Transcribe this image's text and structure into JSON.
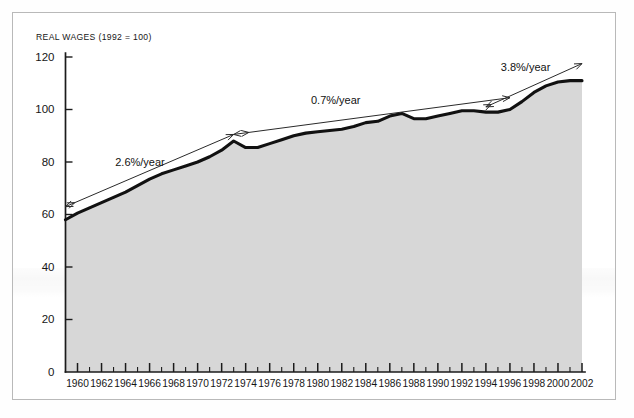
{
  "chart_data": {
    "type": "area",
    "title": "REAL WAGES (1992 = 100)",
    "xlabel": "",
    "ylabel": "",
    "xlim": [
      1959,
      2002
    ],
    "ylim": [
      0,
      120
    ],
    "yticks": [
      0,
      20,
      40,
      60,
      80,
      100,
      120
    ],
    "grid": false,
    "legend": null,
    "x": [
      1959,
      1960,
      1961,
      1962,
      1963,
      1964,
      1965,
      1966,
      1967,
      1968,
      1969,
      1970,
      1971,
      1972,
      1973,
      1974,
      1975,
      1976,
      1977,
      1978,
      1979,
      1980,
      1981,
      1982,
      1983,
      1984,
      1985,
      1986,
      1987,
      1988,
      1989,
      1990,
      1991,
      1992,
      1993,
      1994,
      1995,
      1996,
      1997,
      1998,
      1999,
      2000,
      2001,
      2002
    ],
    "series": [
      {
        "name": "Real wages index",
        "values": [
          58.0,
          60.5,
          62.5,
          64.5,
          66.5,
          68.5,
          71.0,
          73.5,
          75.5,
          77.0,
          78.5,
          80.0,
          82.0,
          84.5,
          88.0,
          85.5,
          85.5,
          87.0,
          88.5,
          90.0,
          91.0,
          91.5,
          92.0,
          92.5,
          93.5,
          95.0,
          95.5,
          97.5,
          98.5,
          96.5,
          96.5,
          97.5,
          98.5,
          99.5,
          99.5,
          99.0,
          99.0,
          100.0,
          103.0,
          106.5,
          109.0,
          110.5,
          111.0,
          111.0
        ]
      }
    ],
    "annotations": [
      {
        "label": "2.6%/year",
        "x_start": 1959,
        "x_end": 1973,
        "y_start": 63.0,
        "y_end": 90.5,
        "label_x": 1965.2,
        "label_y": 78.5,
        "arrow": "both"
      },
      {
        "label": "0.7%/year",
        "x_start": 1973,
        "x_end": 1996,
        "y_start": 90.5,
        "y_end": 104.5,
        "label_x": 1981.5,
        "label_y": 102.0,
        "arrow": "both"
      },
      {
        "label": "3.8%/year",
        "x_start": 1994,
        "x_end": 2002,
        "y_start": 101.0,
        "y_end": 117.5,
        "label_x": 1997.3,
        "label_y": 114.5,
        "arrow": "both"
      }
    ]
  }
}
